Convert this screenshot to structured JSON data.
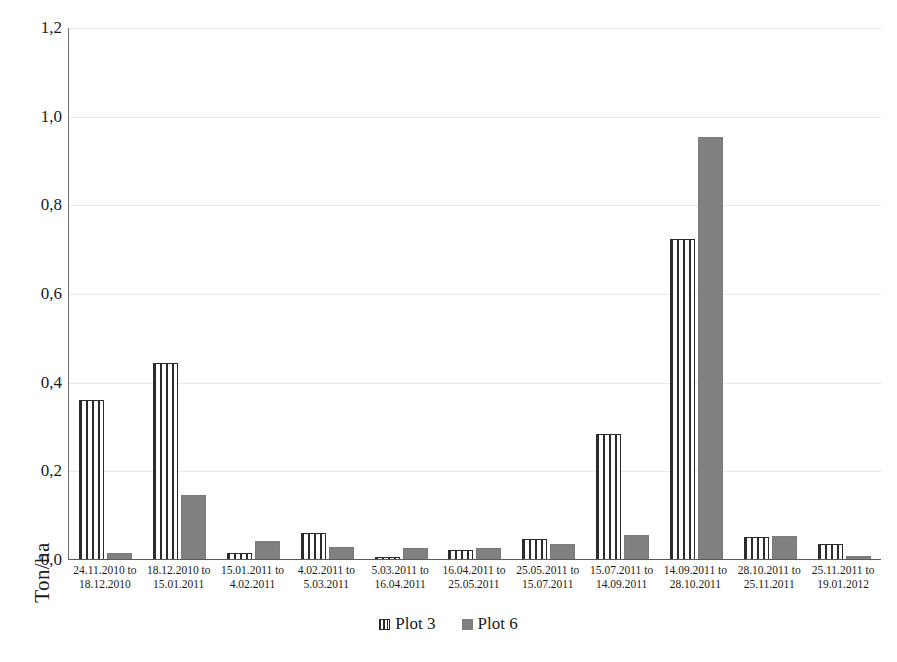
{
  "chart_data": {
    "type": "bar",
    "title": "",
    "xlabel": "",
    "ylabel": "Ton/ha",
    "ylim": [
      0,
      1.2
    ],
    "ytick_step": 0.2,
    "decimal_separator": ",",
    "grid": true,
    "legend_position": "bottom",
    "ytick_labels": [
      "0,0",
      "0,2",
      "0,4",
      "0,6",
      "0,8",
      "1,0",
      "1,2"
    ],
    "ytick_values": [
      0.0,
      0.2,
      0.4,
      0.6,
      0.8,
      1.0,
      1.2
    ],
    "categories": [
      {
        "line1": "24.11.2010 to",
        "line2": "18.12.2010"
      },
      {
        "line1": "18.12.2010 to",
        "line2": "15.01.2011"
      },
      {
        "line1": "15.01.2011 to",
        "line2": "4.02.2011"
      },
      {
        "line1": "4.02.2011 to",
        "line2": "5.03.2011"
      },
      {
        "line1": "5.03.2011 to",
        "line2": "16.04.2011"
      },
      {
        "line1": "16.04.2011 to",
        "line2": "25.05.2011"
      },
      {
        "line1": "25.05.2011 to",
        "line2": "15.07.2011"
      },
      {
        "line1": "15.07.2011 to",
        "line2": "14.09.2011"
      },
      {
        "line1": "14.09.2011 to",
        "line2": "28.10.2011"
      },
      {
        "line1": "28.10.2011 to",
        "line2": "25.11.2011"
      },
      {
        "line1": "25.11.2011 to",
        "line2": "19.01.2012"
      }
    ],
    "series": [
      {
        "name": "Plot 3",
        "color": "#2b2b2b",
        "fill": "vertical-stripes",
        "values": [
          0.36,
          0.444,
          0.015,
          0.062,
          0.007,
          0.022,
          0.048,
          0.284,
          0.725,
          0.053,
          0.035
        ]
      },
      {
        "name": "Plot 6",
        "color": "#808080",
        "fill": "solid",
        "values": [
          0.016,
          0.146,
          0.042,
          0.029,
          0.027,
          0.028,
          0.036,
          0.056,
          0.955,
          0.055,
          0.008
        ]
      }
    ]
  },
  "legend": {
    "items": [
      {
        "label": "Plot 3"
      },
      {
        "label": "Plot 6"
      }
    ]
  }
}
